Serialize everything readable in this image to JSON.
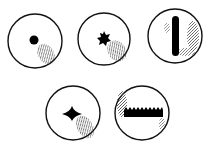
{
  "figure": {
    "stroke_color": "#111111",
    "fill_color": "#000000",
    "background": "#ffffff",
    "panels": [
      {
        "id": "panel-1",
        "shape": "dot",
        "cx": 35,
        "cy": 41,
        "r": 27
      },
      {
        "id": "panel-2",
        "shape": "star-cluster",
        "cx": 104,
        "cy": 39,
        "r": 26
      },
      {
        "id": "panel-3",
        "shape": "vertical-rod",
        "cx": 175,
        "cy": 36,
        "r": 27
      },
      {
        "id": "panel-4",
        "shape": "four-point-star",
        "cx": 73,
        "cy": 113,
        "r": 27
      },
      {
        "id": "panel-5",
        "shape": "serrated-bar",
        "cx": 142,
        "cy": 113,
        "r": 27
      }
    ]
  }
}
